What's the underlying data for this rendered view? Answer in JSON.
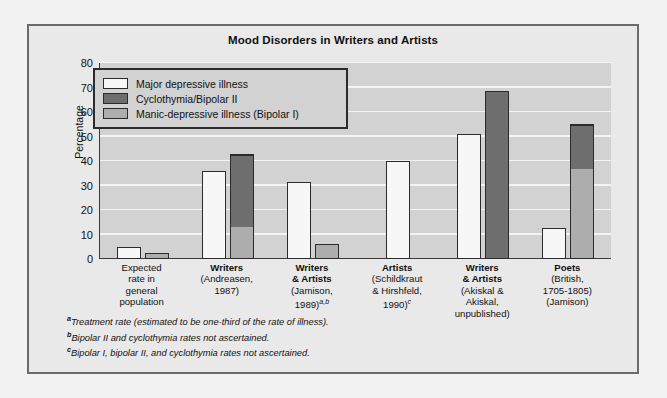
{
  "chart_data": {
    "type": "bar",
    "title": "Mood Disorders in Writers and Artists",
    "xlabel": "",
    "ylabel": "Percentage",
    "ylim": [
      0,
      80
    ],
    "yticks": [
      0,
      10,
      20,
      30,
      40,
      50,
      60,
      70,
      80
    ],
    "grid": true,
    "legend_position": "upper-left inside plot",
    "stacked": true,
    "categories": [
      "Expected rate in general population",
      "Writers (Andreasen, 1987)",
      "Writers & Artists (Jamison, 1989)",
      "Artists (Schildkraut & Hirshfeld, 1990)",
      "Writers & Artists (Akiskal & Akiskal, unpublished)",
      "Poets (British, 1705-1805) (Jamison)"
    ],
    "series": [
      {
        "name": "Major depressive illness",
        "color": "#f7f7f7",
        "values": [
          5,
          36,
          31.5,
          40,
          51,
          12.5
        ]
      },
      {
        "name": "Manic-depressive illness (Bipolar I)",
        "color": "#adadad",
        "values": [
          2.5,
          13,
          6,
          null,
          null,
          37
        ]
      },
      {
        "name": "Cyclothymia/Bipolar II",
        "color": "#6e6e6e",
        "values": [
          null,
          30,
          null,
          null,
          68.5,
          18
        ]
      }
    ],
    "stack_totals": {
      "note": "second bar of each group stacks Manic-depressive (bottom) + Cyclothymia/Bipolar II (top)",
      "values": [
        2.5,
        43,
        6,
        null,
        68.5,
        55
      ]
    },
    "annotations": [
      "a Treatment rate (estimated to be one-third of the rate of illness).",
      "b Bipolar II and cyclothymia rates not ascertained.",
      "c Bipolar I, bipolar II, and cyclothymia rates not ascertained."
    ]
  },
  "chart": {
    "title": "Mood Disorders in Writers and Artists",
    "y_axis_label": "Percentage",
    "y_ticks": [
      "80",
      "70",
      "60",
      "50",
      "40",
      "30",
      "20",
      "10",
      "0"
    ]
  },
  "legend": {
    "items": [
      {
        "label": "Major depressive illness",
        "color": "#f7f7f7"
      },
      {
        "label": "Cyclothymia/Bipolar II",
        "color": "#6e6e6e"
      },
      {
        "label": "Manic-depressive illness (Bipolar I)",
        "color": "#adadad"
      }
    ]
  },
  "categories": [
    {
      "head": "",
      "line1": "Expected",
      "line2": "rate in",
      "line3": "general",
      "line4": "population",
      "sup": ""
    },
    {
      "head": "Writers",
      "line1": "(Andreasen,",
      "line2": "1987)",
      "line3": "",
      "line4": "",
      "sup": ""
    },
    {
      "head": "Writers",
      "head2": "& Artists",
      "line1": "(Jamison,",
      "line2": "1989)",
      "line3": "",
      "line4": "",
      "sup": "a,b"
    },
    {
      "head": "Artists",
      "line1": "(Schildkraut",
      "line2": "& Hirshfeld,",
      "line3": "1990)",
      "line4": "",
      "sup": "c"
    },
    {
      "head": "Writers",
      "head2": "& Artists",
      "line1": "(Akiskal &",
      "line2": "Akiskal,",
      "line3": "unpublished)",
      "line4": "",
      "sup": ""
    },
    {
      "head": "Poets",
      "line1": "(British,",
      "line2": "1705-1805)",
      "line3": "(Jamison)",
      "line4": "",
      "sup": ""
    }
  ],
  "footnotes": [
    {
      "marker": "a",
      "text": "Treatment rate (estimated to be one-third of the rate of illness)."
    },
    {
      "marker": "b",
      "text": "Bipolar II and cyclothymia rates not ascertained."
    },
    {
      "marker": "c",
      "text": "Bipolar I, bipolar II, and cyclothymia rates not ascertained."
    }
  ]
}
